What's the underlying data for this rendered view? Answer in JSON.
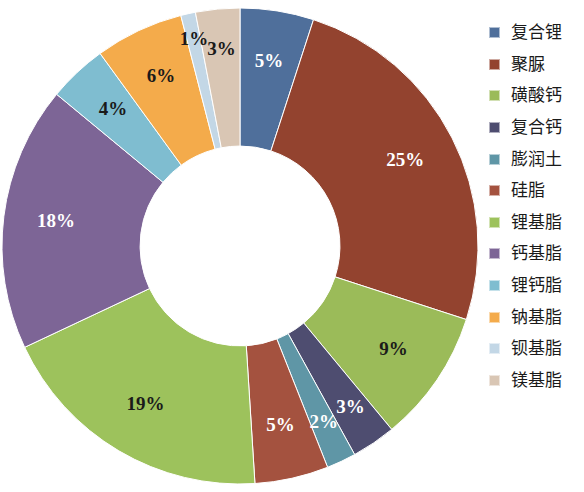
{
  "chart_data": {
    "type": "pie",
    "variant": "donut",
    "title": "",
    "subtitle": "",
    "xlabel": "",
    "ylabel": "",
    "grid": false,
    "legend_position": "right",
    "units": "%",
    "start_angle_deg": 0,
    "direction": "clockwise",
    "inner_radius_ratio": 0.42,
    "total": 100,
    "categories": [
      "复合锂",
      "聚脲",
      "磺酸钙",
      "复合钙",
      "膨润土",
      "硅脂",
      "锂基脂",
      "钙基脂",
      "锂钙脂",
      "钠基脂",
      "钡基脂",
      "镁基脂"
    ],
    "values": [
      5,
      25,
      9,
      3,
      2,
      5,
      19,
      18,
      4,
      6,
      1,
      3
    ],
    "labels": [
      "5%",
      "25%",
      "9%",
      "3%",
      "2%",
      "5%",
      "19%",
      "18%",
      "4%",
      "6%",
      "1%",
      "3%"
    ],
    "colors": [
      "#4f6f9b",
      "#93432f",
      "#9bbb59",
      "#4e4d70",
      "#5f96a6",
      "#a4523f",
      "#9dc25c",
      "#7d6596",
      "#7fbdd0",
      "#f4ab4b",
      "#c3d7e6",
      "#d9c6b4"
    ],
    "label_text_colors": [
      "#ffffff",
      "#ffffff",
      "#1a1a1a",
      "#ffffff",
      "#ffffff",
      "#ffffff",
      "#1a1a1a",
      "#ffffff",
      "#1a1a1a",
      "#1a1a1a",
      "#1a1a1a",
      "#1a1a1a"
    ]
  },
  "legend": {
    "items": [
      {
        "label": "复合锂",
        "color": "#4f6f9b",
        "value": 5
      },
      {
        "label": "聚脲",
        "color": "#93432f",
        "value": 25
      },
      {
        "label": "磺酸钙",
        "color": "#9bbb59",
        "value": 9
      },
      {
        "label": "复合钙",
        "color": "#4e4d70",
        "value": 3
      },
      {
        "label": "膨润土",
        "color": "#5f96a6",
        "value": 2
      },
      {
        "label": "硅脂",
        "color": "#a4523f",
        "value": 5
      },
      {
        "label": "锂基脂",
        "color": "#9dc25c",
        "value": 19
      },
      {
        "label": "钙基脂",
        "color": "#7d6596",
        "value": 18
      },
      {
        "label": "锂钙脂",
        "color": "#7fbdd0",
        "value": 4
      },
      {
        "label": "钠基脂",
        "color": "#f4ab4b",
        "value": 6
      },
      {
        "label": "钡基脂",
        "color": "#c3d7e6",
        "value": 1
      },
      {
        "label": "镁基脂",
        "color": "#d9c6b4",
        "value": 3
      }
    ]
  }
}
